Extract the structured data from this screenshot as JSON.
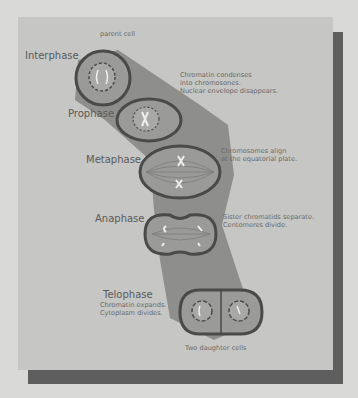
{
  "diagram": {
    "top_label": "parent cell",
    "bottom_label": "Two daughter cells",
    "stages": [
      {
        "name": "Interphase",
        "description": ""
      },
      {
        "name": "Prophase",
        "description_lines": [
          "Chromatin condenses",
          "into chromosones.",
          "Nuclear envelope disappears."
        ]
      },
      {
        "name": "Metaphase",
        "description_lines": [
          "Chromosomes align",
          "at the equatorial plate."
        ]
      },
      {
        "name": "Anaphase",
        "description_lines": [
          "Sister chromatids separate.",
          "Centomeres divide."
        ]
      },
      {
        "name": "Telophase",
        "description_lines": [
          "Chromatin expands.",
          "Cytoplasm divides."
        ]
      }
    ],
    "colors": {
      "background": "#d9d9d7",
      "panel": "#c6c6c4",
      "shadow": "#5e5e5e",
      "band": "#8e8e8c",
      "cell_fill": "#9a9a98",
      "cell_outline": "#4a4a4a",
      "text": "#5a5a5a"
    }
  }
}
